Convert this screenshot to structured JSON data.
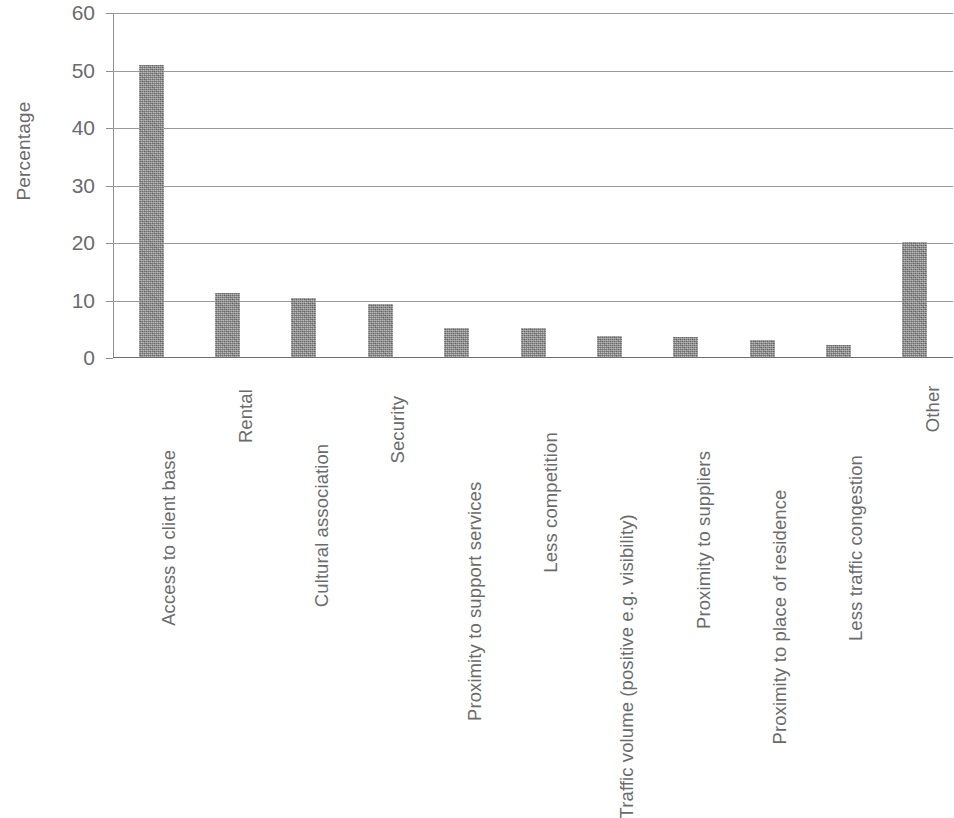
{
  "chart_data": {
    "type": "bar",
    "title": "",
    "subtitle": "",
    "xlabel": "",
    "ylabel": "Percentage",
    "ylim": [
      0,
      60
    ],
    "yticks": [
      0,
      10,
      20,
      30,
      40,
      50,
      60
    ],
    "ytick_labels": [
      "0",
      "10",
      "20",
      "30",
      "40",
      "50",
      "60"
    ],
    "grid": true,
    "legend": null,
    "legend_position": "none",
    "orientation": "vertical",
    "bar_color": "#8d8d8d",
    "categories": [
      "Access to client base",
      "Rental",
      "Cultural association",
      "Security",
      "Proximity to support services",
      "Less competition",
      "Traffic volume (positive e.g. visibility)",
      "Proximity to suppliers",
      "Proximity to place of residence",
      "Less traffic congestion",
      "Other"
    ],
    "values": [
      50.8,
      11.1,
      10.3,
      9.2,
      5.0,
      5.0,
      3.6,
      3.5,
      2.9,
      2.1,
      20.0
    ]
  },
  "axis": {
    "y_title": "Percentage"
  }
}
